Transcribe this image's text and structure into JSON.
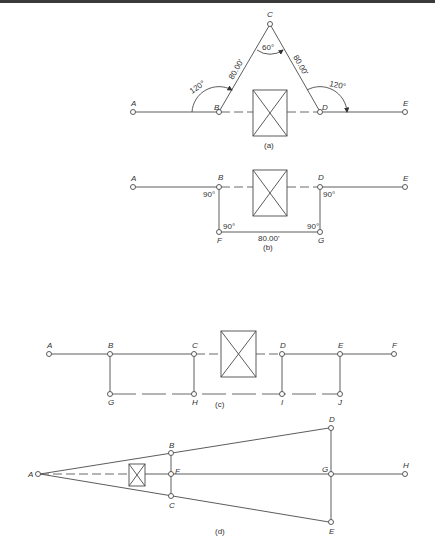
{
  "figure": {
    "panels": [
      {
        "id": "a",
        "caption": "(a)",
        "points": [
          "A",
          "B",
          "C",
          "D",
          "E"
        ],
        "angles": {
          "at_B": "120°",
          "at_C": "60°",
          "at_D": "120°"
        },
        "distances": {
          "BC": "80.00'",
          "CD": "80.00'"
        }
      },
      {
        "id": "b",
        "caption": "(b)",
        "points": [
          "A",
          "B",
          "D",
          "E",
          "F",
          "G"
        ],
        "angles": {
          "at_B": "90°",
          "at_F": "90°",
          "at_G": "90°",
          "at_D": "90°"
        },
        "distances": {
          "FG": "80.00'"
        }
      },
      {
        "id": "c",
        "caption": "(c)",
        "points": [
          "A",
          "B",
          "C",
          "D",
          "E",
          "F",
          "G",
          "H",
          "I",
          "J"
        ]
      },
      {
        "id": "d",
        "caption": "(d)",
        "points": [
          "A",
          "B",
          "C",
          "D",
          "E",
          "F",
          "G",
          "H"
        ]
      }
    ]
  },
  "labels": {
    "a": {
      "A": "A",
      "B": "B",
      "C": "C",
      "D": "D",
      "E": "E",
      "ang_b": "120°",
      "ang_c": "60°",
      "ang_d": "120°",
      "dist_bc": "80.00'",
      "dist_cd": "80.00'",
      "caption": "(a)"
    },
    "b": {
      "A": "A",
      "B": "B",
      "D": "D",
      "E": "E",
      "F": "F",
      "G": "G",
      "ang_b": "90°",
      "ang_f": "90°",
      "ang_g": "90°",
      "ang_d": "90°",
      "dist_fg": "80.00'",
      "caption": "(b)"
    },
    "c": {
      "A": "A",
      "B": "B",
      "C": "C",
      "D": "D",
      "E": "E",
      "F": "F",
      "G": "G",
      "H": "H",
      "I": "I",
      "J": "J",
      "caption": "(c)"
    },
    "d": {
      "A": "A",
      "B": "B",
      "C": "C",
      "D": "D",
      "E": "E",
      "F": "F",
      "G": "G",
      "H": "H",
      "caption": "(d)"
    }
  }
}
